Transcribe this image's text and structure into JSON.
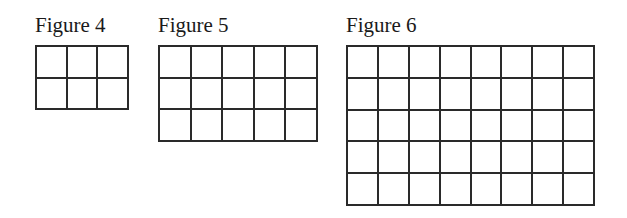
{
  "figures": [
    {
      "label": "Figure 4",
      "columns": 3,
      "rows": 2,
      "cell_count": 6,
      "position": {
        "left": 35,
        "top": 15
      },
      "grid_size": {
        "width": 94,
        "height": 65
      }
    },
    {
      "label": "Figure 5",
      "columns": 5,
      "rows": 3,
      "cell_count": 15,
      "position": {
        "left": 158,
        "top": 15
      },
      "grid_size": {
        "width": 160,
        "height": 97
      }
    },
    {
      "label": "Figure 6",
      "columns": 8,
      "rows": 5,
      "cell_count": 40,
      "position": {
        "left": 346,
        "top": 15
      },
      "grid_size": {
        "width": 249,
        "height": 161
      }
    }
  ],
  "colors": {
    "line": "#2a2a2a",
    "text": "#1a1a1a",
    "background": "#ffffff"
  }
}
